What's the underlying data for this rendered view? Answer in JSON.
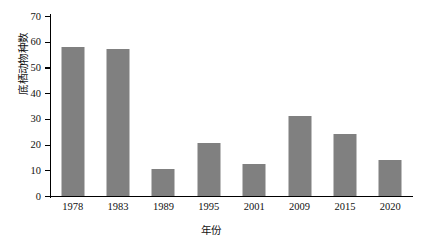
{
  "chart_data": {
    "type": "bar",
    "title": "",
    "xlabel": "年份",
    "ylabel": "底栖动物种数",
    "categories": [
      "1978",
      "1983",
      "1989",
      "1995",
      "2001",
      "2009",
      "2015",
      "2020"
    ],
    "values": [
      58,
      57,
      10.5,
      20.5,
      12.5,
      31,
      24,
      14
    ],
    "series": [
      {
        "name": "底栖动物种数",
        "values": [
          58,
          57,
          10.5,
          20.5,
          12.5,
          31,
          24,
          14
        ]
      }
    ],
    "ylim": [
      0,
      70
    ],
    "ytick_labels": [
      "0",
      "10",
      "20",
      "30",
      "40",
      "50",
      "60",
      "70"
    ],
    "ytick_values": [
      0,
      10,
      20,
      30,
      40,
      50,
      60,
      70
    ],
    "grid": false,
    "legend": "none",
    "bar_color": "#808080",
    "axis_color": "#000000",
    "background_color": "#ffffff"
  }
}
